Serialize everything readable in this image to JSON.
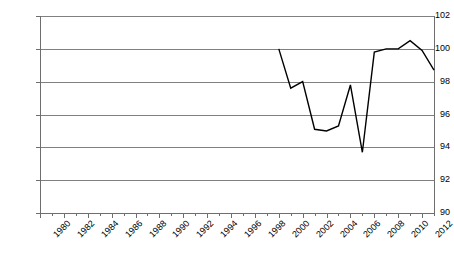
{
  "chart_data": {
    "type": "line",
    "title": "",
    "xlabel": "",
    "ylabel": "",
    "xlim": [
      1980,
      2013
    ],
    "ylim": [
      90,
      102
    ],
    "grid": true,
    "legend": false,
    "x_ticks": [
      1980,
      1982,
      1984,
      1986,
      1988,
      1990,
      1992,
      1994,
      1996,
      1998,
      2000,
      2002,
      2004,
      2006,
      2008,
      2010,
      2012
    ],
    "x_minor_ticks": [
      1981,
      1983,
      1985,
      1987,
      1989,
      1991,
      1993,
      1995,
      1997,
      1999,
      2001,
      2003,
      2005,
      2007,
      2009,
      2011,
      2013
    ],
    "y_ticks": [
      90,
      92,
      94,
      96,
      98,
      100,
      102
    ],
    "series": [
      {
        "name": "series-1",
        "color": "#000000",
        "x": [
          2000,
          2001,
          2002,
          2003,
          2004,
          2005,
          2006,
          2007,
          2008,
          2009,
          2010,
          2011,
          2012,
          2013
        ],
        "values": [
          100.0,
          97.6,
          98.0,
          95.1,
          95.0,
          95.3,
          97.8,
          93.7,
          99.8,
          100.0,
          100.0,
          100.5,
          99.9,
          98.7
        ]
      }
    ]
  }
}
